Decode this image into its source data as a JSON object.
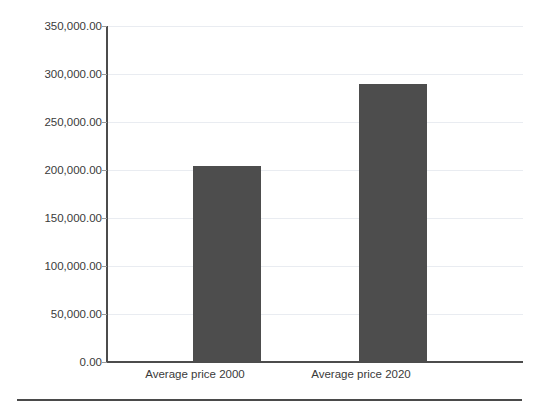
{
  "chart_data": {
    "type": "bar",
    "title": "",
    "xlabel": "",
    "ylabel": "",
    "categories": [
      "Average price 2000",
      "Average price 2020"
    ],
    "values": [
      204000.0,
      290000.0
    ],
    "ylim": [
      0,
      350000
    ],
    "ytick_values": [
      0,
      50000,
      100000,
      150000,
      200000,
      250000,
      300000,
      350000
    ],
    "ytick_labels": [
      "0.00",
      "50,000.00",
      "100,000.00",
      "150,000.00",
      "200,000.00",
      "250,000.00",
      "300,000.00",
      "350,000.00"
    ],
    "grid": true,
    "legend": false,
    "legend_position": "none",
    "bar_color": "#4d4d4d",
    "gridline_color": "#e9ecf1",
    "axis_color": "#4c4c4c"
  },
  "axis": {
    "y": {
      "t0": "0.00",
      "t1": "50,000.00",
      "t2": "100,000.00",
      "t3": "150,000.00",
      "t4": "200,000.00",
      "t5": "250,000.00",
      "t6": "300,000.00",
      "t7": "350,000.00"
    },
    "x": {
      "c0": "Average price 2000",
      "c1": "Average price 2020"
    }
  }
}
